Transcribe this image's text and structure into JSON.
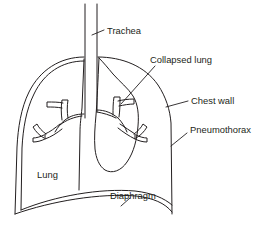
{
  "figure": {
    "type": "anatomical-diagram",
    "background_color": "#ffffff",
    "stroke_color": "#231f20",
    "width": 265,
    "height": 237
  },
  "labels": {
    "trachea": "Trachea",
    "collapsed_lung": "Collapsed lung",
    "chest_wall": "Chest wall",
    "pneumothorax": "Pneumothorax",
    "lung": "Lung",
    "diaphragm": "Diaphragm"
  },
  "label_positions": {
    "trachea": {
      "x": 107,
      "y": 31
    },
    "collapsed_lung": {
      "x": 150,
      "y": 60
    },
    "chest_wall": {
      "x": 191,
      "y": 101
    },
    "pneumothorax": {
      "x": 190,
      "y": 130
    },
    "lung": {
      "x": 37,
      "y": 175
    },
    "diaphragm": {
      "x": 110,
      "y": 196
    }
  },
  "structures": [
    {
      "name": "trachea",
      "description": "two parallel vertical tubes descending from top center"
    },
    {
      "name": "chest-wall",
      "description": "outer thoracic cage arc, left and right"
    },
    {
      "name": "left-lung",
      "description": "normally inflated lung filling left hemithorax"
    },
    {
      "name": "collapsed-lung",
      "description": "shrunken right lung pulled toward mediastinum"
    },
    {
      "name": "bronchial-tree-left",
      "description": "branching airways in left lung"
    },
    {
      "name": "bronchial-tree-right",
      "description": "branching airways in collapsed lung"
    },
    {
      "name": "diaphragm",
      "description": "double curved line across base of thorax"
    },
    {
      "name": "pneumothorax-space",
      "description": "air gap between collapsed lung and right chest wall"
    }
  ]
}
